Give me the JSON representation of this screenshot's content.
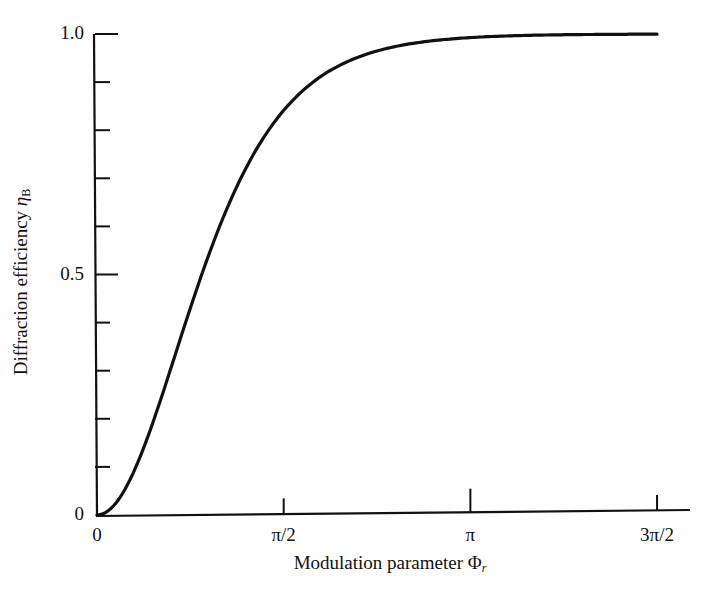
{
  "chart_data": {
    "type": "line",
    "title": "",
    "xlabel": "Modulation parameter Φr",
    "ylabel": "Diffraction efficiency ηB",
    "xlabel_parts": {
      "text": "Modulation parameter ",
      "symbol": "Φ",
      "subscript": "r"
    },
    "ylabel_parts": {
      "text": "Diffraction efficiency ",
      "symbol": "η",
      "subscript": "B"
    },
    "xlim": [
      0,
      4.712
    ],
    "ylim": [
      0,
      1.0
    ],
    "x_ticks": [
      {
        "value": 0,
        "label": "0"
      },
      {
        "value": 1.5708,
        "label": "π/2"
      },
      {
        "value": 3.1416,
        "label": "π"
      },
      {
        "value": 4.7124,
        "label": "3π/2"
      }
    ],
    "y_ticks": [
      {
        "value": 0,
        "label": "0"
      },
      {
        "value": 0.5,
        "label": "0.5"
      },
      {
        "value": 1.0,
        "label": "1.0"
      }
    ],
    "y_minor_ticks": [
      0.1,
      0.2,
      0.3,
      0.4,
      0.6,
      0.7,
      0.8,
      0.9
    ],
    "grid": false,
    "legend": null,
    "series": [
      {
        "name": "ηB = tanh²(Φr)",
        "x": [
          0,
          0.2,
          0.4,
          0.6,
          0.8,
          1.0,
          1.2,
          1.4,
          1.5708,
          1.8,
          2.0,
          2.4,
          2.8,
          3.1416,
          3.6,
          4.0,
          4.4,
          4.7124
        ],
        "y": [
          0,
          0.039,
          0.144,
          0.288,
          0.443,
          0.58,
          0.695,
          0.784,
          0.843,
          0.896,
          0.929,
          0.967,
          0.985,
          0.993,
          0.997,
          0.999,
          1.0,
          1.0
        ]
      }
    ]
  }
}
